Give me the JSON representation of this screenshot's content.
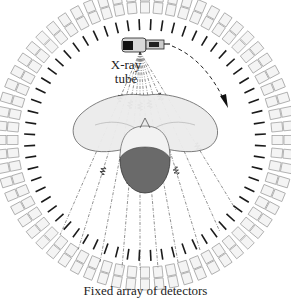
{
  "diagram": {
    "labels": {
      "tube_line1": "X-ray",
      "tube_line2": "tube",
      "caption": "Fixed array of detectors"
    },
    "components": [
      {
        "id": "detector-ring",
        "name": "Fixed array of detectors",
        "shape": "ring of rectangular detector blocks"
      },
      {
        "id": "collimator-ring",
        "name": "Collimator ticks",
        "shape": "ring of short black radial bars"
      },
      {
        "id": "xray-tube",
        "name": "X-ray tube",
        "shape": "tube housing at top of ring"
      },
      {
        "id": "rotation-arrow",
        "name": "Rotation direction",
        "shape": "dashed clockwise arc arrow"
      },
      {
        "id": "xray-fan",
        "name": "X-ray fan beam",
        "shape": "dash-dot rays with wave packets"
      },
      {
        "id": "patient-head",
        "name": "Patient head and shoulders",
        "shape": "top-down head with shoulders"
      }
    ],
    "colors": {
      "detector_stroke": "#9a9a9a",
      "detector_fill": "#f4f4f4",
      "tick": "#1a1a1a",
      "head_dark": "#5e5e5e",
      "shoulder_fill": "#ececec",
      "ray": "#444444"
    },
    "geometry": {
      "center_x": 145,
      "center_y": 140,
      "detector_count": 64,
      "tick_count": 64
    }
  }
}
